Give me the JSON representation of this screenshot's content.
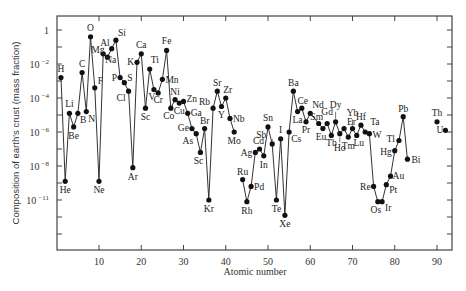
{
  "chart_data": {
    "type": "line",
    "title": "",
    "xlabel": "Atomic number",
    "ylabel": "Composition of earth's crust (mass fraction)",
    "yscale": "log",
    "xlim": [
      0,
      94
    ],
    "ylim_log10": [
      -12.9,
      0.9
    ],
    "x_ticks": [
      10,
      20,
      30,
      40,
      50,
      60,
      70,
      80,
      90
    ],
    "y_ticks": [
      {
        "label": "1",
        "base": "1",
        "exp": "",
        "log10": 0
      },
      {
        "label": "10^-2",
        "base": "10",
        "exp": "−2",
        "log10": -2
      },
      {
        "label": "10^-4",
        "base": "10",
        "exp": "−4",
        "log10": -4
      },
      {
        "label": "10^-6",
        "base": "10",
        "exp": "−6",
        "log10": -6
      },
      {
        "label": "10^-8",
        "base": "10",
        "exp": "−8",
        "log10": -8
      },
      {
        "label": "10^-11",
        "base": "10",
        "exp": "−11",
        "log10": -10
      }
    ],
    "grid": false,
    "legend": null,
    "segments": [
      [
        {
          "z": 1,
          "el": "H",
          "log10": -2.8,
          "lx": 0,
          "ly": -6,
          "anchor": "middle"
        },
        {
          "z": 2,
          "el": "He",
          "log10": -8.9,
          "lx": 0,
          "ly": 12,
          "anchor": "middle"
        },
        {
          "z": 3,
          "el": "Li",
          "log10": -4.9,
          "lx": 0,
          "ly": -6,
          "anchor": "middle"
        },
        {
          "z": 4,
          "el": "Be",
          "log10": -5.7,
          "lx": 0,
          "ly": 12,
          "anchor": "middle"
        },
        {
          "z": 5,
          "el": "B",
          "log10": -4.9,
          "lx": 2,
          "ly": 10,
          "anchor": "start"
        },
        {
          "z": 6,
          "el": "C",
          "log10": -2.5,
          "lx": 0,
          "ly": -6,
          "anchor": "middle"
        },
        {
          "z": 7,
          "el": "N",
          "log10": -4.8,
          "lx": 2,
          "ly": 10,
          "anchor": "start"
        },
        {
          "z": 8,
          "el": "O",
          "log10": -0.4,
          "lx": 0,
          "ly": -6,
          "anchor": "middle"
        },
        {
          "z": 9,
          "el": "F",
          "log10": -3.4,
          "lx": 3,
          "ly": -4,
          "anchor": "start"
        },
        {
          "z": 10,
          "el": "Ne",
          "log10": -8.9,
          "lx": 0,
          "ly": 12,
          "anchor": "middle"
        },
        {
          "z": 11,
          "el": "Na",
          "log10": -1.4,
          "lx": 2,
          "ly": 9,
          "anchor": "start"
        },
        {
          "z": 12,
          "el": "Mg",
          "log10": -1.6,
          "lx": -3,
          "ly": -4,
          "anchor": "end"
        },
        {
          "z": 13,
          "el": "Al",
          "log10": -1.1,
          "lx": -2,
          "ly": -3,
          "anchor": "end"
        },
        {
          "z": 14,
          "el": "Si",
          "log10": -0.6,
          "lx": 2,
          "ly": -4,
          "anchor": "start"
        },
        {
          "z": 15,
          "el": "P",
          "log10": -2.8,
          "lx": -3,
          "ly": 3,
          "anchor": "end"
        },
        {
          "z": 16,
          "el": "S",
          "log10": -3.1,
          "lx": 3,
          "ly": -2,
          "anchor": "start"
        },
        {
          "z": 17,
          "el": "Cl",
          "log10": -3.6,
          "lx": -3,
          "ly": 10,
          "anchor": "end"
        },
        {
          "z": 18,
          "el": "Ar",
          "log10": -8.1,
          "lx": 0,
          "ly": 12,
          "anchor": "middle"
        },
        {
          "z": 19,
          "el": "K",
          "log10": -1.9,
          "lx": -3,
          "ly": 3,
          "anchor": "end"
        },
        {
          "z": 20,
          "el": "Ca",
          "log10": -1.4,
          "lx": 0,
          "ly": -6,
          "anchor": "middle"
        },
        {
          "z": 21,
          "el": "Sc",
          "log10": -4.6,
          "lx": 0,
          "ly": 12,
          "anchor": "middle"
        },
        {
          "z": 22,
          "el": "Ti",
          "log10": -2.3,
          "lx": 1,
          "ly": -6,
          "anchor": "start"
        },
        {
          "z": 23,
          "el": "V",
          "log10": -3.5,
          "lx": -2,
          "ly": 10,
          "anchor": "middle"
        },
        {
          "z": 24,
          "el": "Cr",
          "log10": -3.7,
          "lx": 0,
          "ly": 10,
          "anchor": "middle"
        },
        {
          "z": 25,
          "el": "Mn",
          "log10": -2.9,
          "lx": 3,
          "ly": 4,
          "anchor": "start"
        },
        {
          "z": 26,
          "el": "Fe",
          "log10": -1.2,
          "lx": 0,
          "ly": -6,
          "anchor": "middle"
        },
        {
          "z": 27,
          "el": "Co",
          "log10": -4.6,
          "lx": -2,
          "ly": 11,
          "anchor": "middle"
        },
        {
          "z": 28,
          "el": "Ni",
          "log10": -4.1,
          "lx": 0,
          "ly": -5,
          "anchor": "middle"
        },
        {
          "z": 29,
          "el": "Cu",
          "log10": -4.3,
          "lx": 0,
          "ly": 11,
          "anchor": "middle"
        },
        {
          "z": 30,
          "el": "Zn",
          "log10": -4.2,
          "lx": 3,
          "ly": 1,
          "anchor": "start"
        },
        {
          "z": 31,
          "el": "Ga",
          "log10": -4.9,
          "lx": 3,
          "ly": 3,
          "anchor": "start"
        },
        {
          "z": 32,
          "el": "Ge",
          "log10": -5.8,
          "lx": -3,
          "ly": 2,
          "anchor": "end"
        },
        {
          "z": 33,
          "el": "As",
          "log10": -6.1,
          "lx": -3,
          "ly": 10,
          "anchor": "end"
        },
        {
          "z": 34,
          "el": "Sc",
          "log10": -7.2,
          "lx": -2,
          "ly": 12,
          "anchor": "middle"
        },
        {
          "z": 35,
          "el": "Br",
          "log10": -5.8,
          "lx": 0,
          "ly": -5,
          "anchor": "middle"
        },
        {
          "z": 36,
          "el": "Kr",
          "log10": -10.0,
          "lx": 0,
          "ly": 12,
          "anchor": "middle"
        },
        {
          "z": 37,
          "el": "Rb",
          "log10": -4.6,
          "lx": -3,
          "ly": -3,
          "anchor": "end"
        },
        {
          "z": 38,
          "el": "Sr",
          "log10": -3.6,
          "lx": 0,
          "ly": -5,
          "anchor": "middle"
        },
        {
          "z": 39,
          "el": "Y",
          "log10": -4.5,
          "lx": 0,
          "ly": 11,
          "anchor": "middle"
        },
        {
          "z": 40,
          "el": "Zr",
          "log10": -4.0,
          "lx": 2,
          "ly": -5,
          "anchor": "middle"
        },
        {
          "z": 41,
          "el": "Nb",
          "log10": -5.2,
          "lx": 3,
          "ly": 4,
          "anchor": "start"
        },
        {
          "z": 42,
          "el": "Mo",
          "log10": -6.0,
          "lx": 0,
          "ly": 12,
          "anchor": "middle"
        }
      ],
      [
        {
          "z": 44,
          "el": "Ru",
          "log10": -8.8,
          "lx": 0,
          "ly": -5,
          "anchor": "middle"
        },
        {
          "z": 45,
          "el": "Rh",
          "log10": -10.1,
          "lx": 0,
          "ly": 12,
          "anchor": "middle"
        },
        {
          "z": 46,
          "el": "Pd",
          "log10": -9.2,
          "lx": 3,
          "ly": 4,
          "anchor": "start"
        },
        {
          "z": 47,
          "el": "Ag",
          "log10": -7.2,
          "lx": -3,
          "ly": 4,
          "anchor": "end"
        },
        {
          "z": 48,
          "el": "Cd",
          "log10": -7.0,
          "lx": -1,
          "ly": -5,
          "anchor": "middle"
        },
        {
          "z": 49,
          "el": "In",
          "log10": -7.4,
          "lx": 0,
          "ly": 12,
          "anchor": "middle"
        },
        {
          "z": 50,
          "el": "Sn",
          "log10": -5.7,
          "lx": 0,
          "ly": -6,
          "anchor": "middle"
        },
        {
          "z": 51,
          "el": "Sb",
          "log10": -6.7,
          "lx": -6,
          "ly": -6,
          "anchor": "end"
        },
        {
          "z": 52,
          "el": "Te",
          "log10": -10.0,
          "lx": 0,
          "ly": 12,
          "anchor": "middle"
        },
        {
          "z": 53,
          "el": "I",
          "log10": -6.4,
          "lx": 0,
          "ly": -6,
          "anchor": "middle"
        },
        {
          "z": 54,
          "el": "Xe",
          "log10": -10.9,
          "lx": 0,
          "ly": 12,
          "anchor": "middle"
        },
        {
          "z": 55,
          "el": "Cs",
          "log10": -6.0,
          "lx": 2,
          "ly": 10,
          "anchor": "start"
        },
        {
          "z": 56,
          "el": "Ba",
          "log10": -3.6,
          "lx": 0,
          "ly": -5,
          "anchor": "middle"
        },
        {
          "z": 57,
          "el": "La",
          "log10": -4.8,
          "lx": 0,
          "ly": 11,
          "anchor": "middle"
        },
        {
          "z": 58,
          "el": "Ce",
          "log10": -4.6,
          "lx": 1,
          "ly": -4,
          "anchor": "middle"
        },
        {
          "z": 59,
          "el": "Pr",
          "log10": -5.4,
          "lx": 0,
          "ly": 11,
          "anchor": "middle"
        },
        {
          "z": 60,
          "el": "Nd",
          "log10": -4.9,
          "lx": 2,
          "ly": -5,
          "anchor": "start"
        },
        {
          "z": 62,
          "el": "Sm",
          "log10": -5.5,
          "lx": -2,
          "ly": -4,
          "anchor": "middle"
        },
        {
          "z": 63,
          "el": "Eu",
          "log10": -5.8,
          "lx": -2,
          "ly": 11,
          "anchor": "middle"
        },
        {
          "z": 64,
          "el": "Gd",
          "log10": -5.5,
          "lx": 0,
          "ly": -9,
          "anchor": "middle"
        },
        {
          "z": 65,
          "el": "Tb",
          "log10": -6.2,
          "lx": 0,
          "ly": 11,
          "anchor": "middle"
        },
        {
          "z": 66,
          "el": "Dy",
          "log10": -5.4,
          "lx": 0,
          "ly": -14,
          "anchor": "middle"
        },
        {
          "z": 67,
          "el": "Ho",
          "log10": -6.1,
          "lx": 0,
          "ly": 17,
          "anchor": "middle"
        },
        {
          "z": 68,
          "el": "Er",
          "log10": -5.8,
          "lx": 3,
          "ly": -4,
          "anchor": "start"
        },
        {
          "z": 69,
          "el": "Tm",
          "log10": -6.3,
          "lx": 0,
          "ly": 12,
          "anchor": "middle"
        },
        {
          "z": 70,
          "el": "Yb",
          "log10": -5.8,
          "lx": 0,
          "ly": -13,
          "anchor": "middle"
        },
        {
          "z": 71,
          "el": "Lu",
          "log10": -6.2,
          "lx": 2,
          "ly": 11,
          "anchor": "middle"
        },
        {
          "z": 72,
          "el": "Hf",
          "log10": -5.6,
          "lx": 0,
          "ly": -5,
          "anchor": "middle"
        },
        {
          "z": 73,
          "el": "Ta",
          "log10": -6.0,
          "lx": 5,
          "ly": -7,
          "anchor": "start"
        },
        {
          "z": 74,
          "el": "W",
          "log10": -6.1,
          "lx": 3,
          "ly": 4,
          "anchor": "start"
        },
        {
          "z": 75,
          "el": "Re",
          "log10": -9.2,
          "lx": -3,
          "ly": 4,
          "anchor": "end"
        },
        {
          "z": 76,
          "el": "Os",
          "log10": -10.1,
          "lx": -2,
          "ly": 11,
          "anchor": "middle"
        },
        {
          "z": 77,
          "el": "Ir",
          "log10": -10.1,
          "lx": 3,
          "ly": 9,
          "anchor": "start"
        },
        {
          "z": 78,
          "el": "Pt",
          "log10": -9.1,
          "lx": 3,
          "ly": 8,
          "anchor": "start"
        },
        {
          "z": 79,
          "el": "Au",
          "log10": -8.6,
          "lx": 2,
          "ly": 3,
          "anchor": "start"
        },
        {
          "z": 80,
          "el": "Hg",
          "log10": -7.1,
          "lx": -3,
          "ly": 4,
          "anchor": "end"
        },
        {
          "z": 81,
          "el": "Tl",
          "log10": -6.5,
          "lx": -4,
          "ly": 1,
          "anchor": "end"
        },
        {
          "z": 82,
          "el": "Pb",
          "log10": -5.1,
          "lx": 0,
          "ly": -5,
          "anchor": "middle"
        },
        {
          "z": 83,
          "el": "Bi",
          "log10": -7.6,
          "lx": 4,
          "ly": 4,
          "anchor": "start"
        }
      ],
      [
        {
          "z": 90,
          "el": "Th",
          "log10": -5.4,
          "lx": 0,
          "ly": -6,
          "anchor": "middle"
        }
      ],
      [
        {
          "z": 92,
          "el": "U",
          "log10": -5.9,
          "lx": -2,
          "ly": 3,
          "anchor": "end"
        }
      ]
    ]
  },
  "axes": {
    "xlabel": "Atomic number",
    "ylabel": "Composition of earth's crust (mass fraction)"
  }
}
